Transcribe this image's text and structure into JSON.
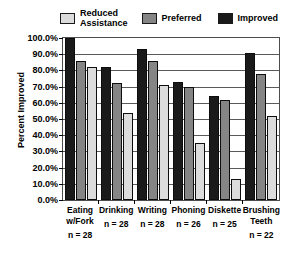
{
  "chart_data": {
    "type": "bar",
    "title": "",
    "xlabel": "",
    "ylabel": "Percent Improved",
    "ylim": [
      0,
      100
    ],
    "ytick_labels": [
      "100.0%",
      "90.0%",
      "80.0%",
      "70.0%",
      "60.0%",
      "50.0%",
      "40.0%",
      "30.0%",
      "20.0%",
      "10.0%",
      "0.0%"
    ],
    "ytick_values": [
      100,
      90,
      80,
      70,
      60,
      50,
      40,
      30,
      20,
      10,
      0
    ],
    "grid": true,
    "legend_position": "top",
    "categories": [
      "Eating\nw/Fork",
      "Drinking",
      "Writing",
      "Phoning",
      "Diskette",
      "Brushing\nTeeth"
    ],
    "category_sublabels": [
      "n = 28",
      "n = 28",
      "n = 28",
      "n = 26",
      "n = 25",
      "n = 22"
    ],
    "legend": [
      "Reduced Assistance",
      "Preferred",
      "Improved"
    ],
    "series": [
      {
        "name": "Improved",
        "color": "#1a1a1a",
        "draw_order": 0,
        "values": [
          100,
          82,
          93,
          73,
          64,
          91
        ]
      },
      {
        "name": "Preferred",
        "color": "#858585",
        "draw_order": 1,
        "values": [
          86,
          72,
          86,
          70,
          62,
          78
        ]
      },
      {
        "name": "Reduced Assistance",
        "color": "#dcdcdc",
        "draw_order": 2,
        "values": [
          82,
          54,
          71,
          35,
          13,
          52
        ]
      }
    ]
  },
  "legend": {
    "items": [
      {
        "label": "Reduced\nAssistance",
        "color": "#dcdcdc"
      },
      {
        "label": "Preferred",
        "color": "#858585"
      },
      {
        "label": "Improved",
        "color": "#1a1a1a"
      }
    ]
  },
  "axes": {
    "y_title": "Percent Improved"
  }
}
